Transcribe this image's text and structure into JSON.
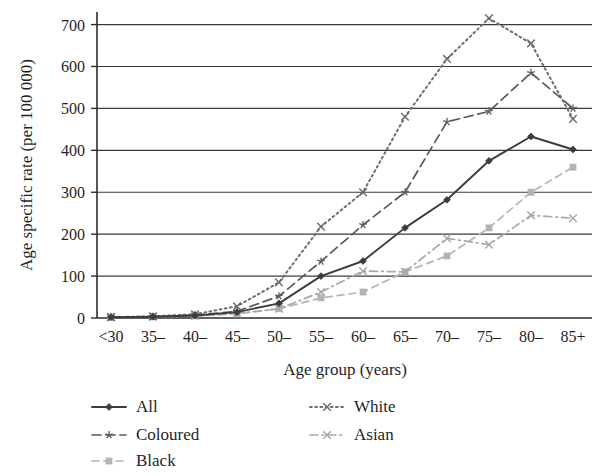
{
  "chart_data": {
    "type": "line",
    "title": "",
    "xlabel": "Age group (years)",
    "ylabel": "Age specific rate (per 100 000)",
    "categories": [
      "<30",
      "35–",
      "40–",
      "45–",
      "50–",
      "55–",
      "60–",
      "65–",
      "70–",
      "75–",
      "80–",
      "85+"
    ],
    "ylim": [
      0,
      730
    ],
    "yticks": [
      0,
      100,
      200,
      300,
      400,
      500,
      600,
      700
    ],
    "ytick_labels": [
      "0",
      "100",
      "200",
      "300",
      "400",
      "500",
      "600",
      "700"
    ],
    "grid": "horizontal",
    "legend_position": "bottom",
    "series": [
      {
        "name": "All",
        "color": "#3c3c3c",
        "dash": "solid",
        "marker": "diamond",
        "values": [
          2,
          3,
          6,
          14,
          35,
          100,
          136,
          215,
          282,
          375,
          433,
          402
        ]
      },
      {
        "name": "Coloured",
        "color": "#5a5a5a",
        "dash": "dashed",
        "marker": "star",
        "values": [
          2,
          3,
          7,
          16,
          52,
          135,
          222,
          300,
          468,
          493,
          585,
          500
        ]
      },
      {
        "name": "Black",
        "color": "#b4b4b4",
        "dash": "dashed-light",
        "marker": "square",
        "values": [
          2,
          3,
          5,
          10,
          22,
          48,
          62,
          110,
          148,
          215,
          300,
          360
        ]
      },
      {
        "name": "White",
        "color": "#6e6e6e",
        "dash": "dotted",
        "marker": "cross",
        "values": [
          2,
          4,
          9,
          28,
          85,
          218,
          300,
          480,
          618,
          715,
          655,
          475
        ]
      },
      {
        "name": "Asian",
        "color": "#a8a8a8",
        "dash": "dash-dot",
        "marker": "cross",
        "values": [
          2,
          3,
          5,
          11,
          22,
          62,
          112,
          110,
          190,
          175,
          245,
          238
        ]
      }
    ]
  },
  "axes": {
    "y_label": "Age specific rate (per 100 000)",
    "x_label": "Age group (years)"
  },
  "legend": {
    "entries": [
      {
        "label": "All"
      },
      {
        "label": "Coloured"
      },
      {
        "label": "Black"
      },
      {
        "label": "White"
      },
      {
        "label": "Asian"
      }
    ]
  }
}
